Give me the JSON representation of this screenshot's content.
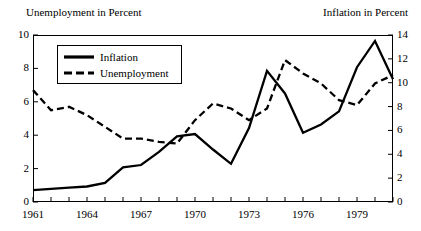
{
  "chart_data": {
    "type": "line",
    "title": "",
    "xlabel": "",
    "ylabel": "Unemployment in Percent",
    "y2label": "Inflation in Percent",
    "grid": false,
    "legend_position": "top-left",
    "xlim": [
      1961,
      1981
    ],
    "ylim": [
      0,
      10
    ],
    "y2lim": [
      0,
      14
    ],
    "x": [
      1961,
      1962,
      1963,
      1964,
      1965,
      1966,
      1967,
      1968,
      1969,
      1970,
      1971,
      1972,
      1973,
      1974,
      1975,
      1976,
      1977,
      1978,
      1979,
      1980,
      1981
    ],
    "xticks": [
      1961,
      1964,
      1967,
      1970,
      1973,
      1976,
      1979
    ],
    "xtick_labels": [
      "1961",
      "1964",
      "1967",
      "1970",
      "1973",
      "1976",
      "1979"
    ],
    "yticks": [
      0,
      2,
      4,
      6,
      8,
      10
    ],
    "ytick_labels": [
      "0",
      "2",
      "4",
      "6",
      "8",
      "10"
    ],
    "y2ticks": [
      0,
      2,
      4,
      6,
      8,
      10,
      12,
      14
    ],
    "y2tick_labels": [
      "0",
      "2",
      "4",
      "6",
      "8",
      "10",
      "12",
      "14"
    ],
    "series": [
      {
        "name": "Inflation",
        "axis": "right",
        "style": "solid",
        "color": "#000000",
        "values": [
          1.0,
          1.1,
          1.2,
          1.3,
          1.6,
          2.9,
          3.1,
          4.2,
          5.5,
          5.7,
          4.4,
          3.2,
          6.2,
          11.0,
          9.1,
          5.8,
          6.5,
          7.6,
          11.3,
          13.5,
          10.3
        ]
      },
      {
        "name": "Unemployment",
        "axis": "left",
        "style": "dashed",
        "color": "#000000",
        "values": [
          6.7,
          5.5,
          5.7,
          5.2,
          4.5,
          3.8,
          3.8,
          3.6,
          3.5,
          4.9,
          5.9,
          5.6,
          4.9,
          5.6,
          8.5,
          7.7,
          7.1,
          6.1,
          5.8,
          7.1,
          7.6
        ]
      }
    ]
  },
  "legend": {
    "inflation_label": "Inflation",
    "unemployment_label": "Unemployment"
  }
}
